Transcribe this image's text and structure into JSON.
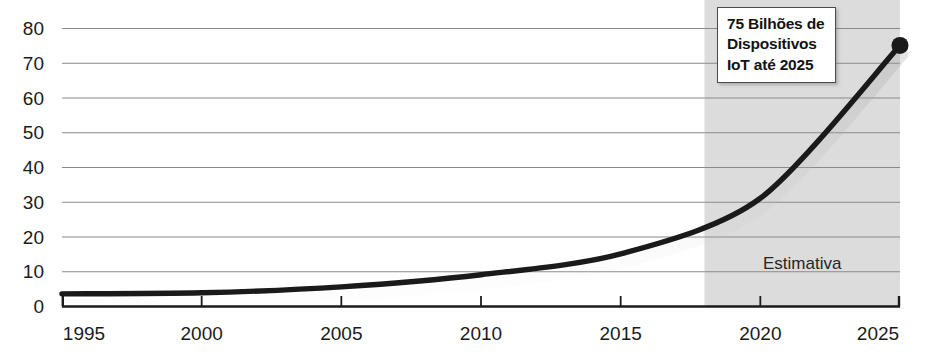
{
  "chart_data": {
    "type": "line",
    "title": "",
    "subtitle": "",
    "xlabel": "",
    "ylabel": "",
    "x": [
      1995,
      2000,
      2005,
      2010,
      2015,
      2020,
      2025
    ],
    "values": [
      3.5,
      3.8,
      5.5,
      9,
      15,
      31,
      75
    ],
    "series": [
      {
        "name": "Dispositivos IoT (bilhões)",
        "values": [
          3.5,
          3.8,
          5.5,
          9,
          15,
          31,
          75
        ]
      }
    ],
    "xlim": [
      1995,
      2025
    ],
    "ylim": [
      0,
      80
    ],
    "xticks": [
      1995,
      2000,
      2005,
      2010,
      2015,
      2020,
      2025
    ],
    "yticks": [
      0,
      10,
      20,
      30,
      40,
      50,
      60,
      70,
      80
    ],
    "xtick_labels": [
      "1995",
      "2000",
      "2005",
      "2010",
      "2015",
      "2020",
      "2025"
    ],
    "ytick_labels": [
      "0",
      "10",
      "20",
      "30",
      "40",
      "50",
      "60",
      "70",
      "80"
    ],
    "grid": true,
    "legend": "none",
    "line_color": "#1a1a1a",
    "marker_color": "#1a1a1a",
    "grid_color": "#8a8a8a",
    "axis_color": "#1b1b1b",
    "shaded_region": {
      "label": "Estimativa",
      "x_start": 2018,
      "x_end": 2025,
      "color": "#dcdcdc"
    },
    "annotations": [
      {
        "name": "callout",
        "lines": [
          "75 Bilhões de",
          "Dispositivos",
          "IoT até 2025"
        ],
        "x": 2025,
        "y": 75
      }
    ]
  },
  "axes": {
    "y_labels": [
      "80",
      "70",
      "60",
      "50",
      "40",
      "30",
      "20",
      "10",
      "0"
    ],
    "x_labels": [
      "1995",
      "2000",
      "2005",
      "2010",
      "2015",
      "2020",
      "2025"
    ]
  },
  "shaded": {
    "label": "Estimativa"
  },
  "callout": {
    "line1": "75 Bilhões de",
    "line2": "Dispositivos",
    "line3": "IoT até 2025"
  }
}
